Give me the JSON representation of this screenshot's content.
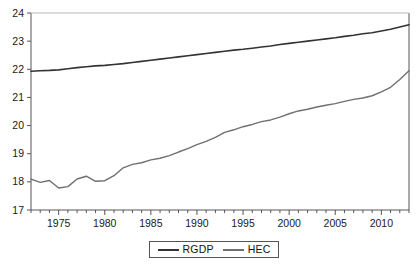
{
  "chart_data": {
    "type": "line",
    "title": "",
    "subtitle": "",
    "xlabel": "",
    "ylabel": "",
    "xlim": [
      1972,
      2013
    ],
    "ylim": [
      17,
      24
    ],
    "grid": false,
    "legend_position": "bottom-center",
    "y_ticks": [
      "17",
      "18",
      "19",
      "20",
      "21",
      "22",
      "23",
      "24"
    ],
    "x_ticks": [
      "1975",
      "1980",
      "1985",
      "1990",
      "1995",
      "2000",
      "2005",
      "2010"
    ],
    "x_minor_tick_interval": 1,
    "x": [
      1972,
      1973,
      1974,
      1975,
      1976,
      1977,
      1978,
      1979,
      1980,
      1981,
      1982,
      1983,
      1984,
      1985,
      1986,
      1987,
      1988,
      1989,
      1990,
      1991,
      1992,
      1993,
      1994,
      1995,
      1996,
      1997,
      1998,
      1999,
      2000,
      2001,
      2002,
      2003,
      2004,
      2005,
      2006,
      2007,
      2008,
      2009,
      2010,
      2011,
      2012,
      2013
    ],
    "series": [
      {
        "name": "RGDP",
        "color": "#333333",
        "width": 1.6,
        "values": [
          21.93,
          21.95,
          21.96,
          21.98,
          22.02,
          22.06,
          22.09,
          22.12,
          22.14,
          22.17,
          22.2,
          22.24,
          22.28,
          22.32,
          22.36,
          22.4,
          22.44,
          22.48,
          22.52,
          22.56,
          22.6,
          22.64,
          22.68,
          22.71,
          22.75,
          22.79,
          22.83,
          22.88,
          22.92,
          22.96,
          23.0,
          23.04,
          23.08,
          23.12,
          23.17,
          23.21,
          23.26,
          23.3,
          23.36,
          23.42,
          23.5,
          23.58
        ]
      },
      {
        "name": "HEC",
        "color": "#707070",
        "width": 1.4,
        "values": [
          18.1,
          17.98,
          18.05,
          17.78,
          17.83,
          18.1,
          18.2,
          18.02,
          18.04,
          18.22,
          18.5,
          18.62,
          18.68,
          18.78,
          18.84,
          18.93,
          19.06,
          19.18,
          19.32,
          19.44,
          19.58,
          19.76,
          19.85,
          19.96,
          20.04,
          20.14,
          20.2,
          20.3,
          20.42,
          20.52,
          20.58,
          20.66,
          20.72,
          20.78,
          20.86,
          20.93,
          20.98,
          21.06,
          21.2,
          21.36,
          21.64,
          21.95
        ]
      }
    ]
  },
  "legend": {
    "entries": [
      {
        "label": "RGDP",
        "swatch": "rgdp"
      },
      {
        "label": "HEC",
        "swatch": "hec"
      }
    ]
  },
  "axis_frame": {
    "color": "#555555"
  }
}
